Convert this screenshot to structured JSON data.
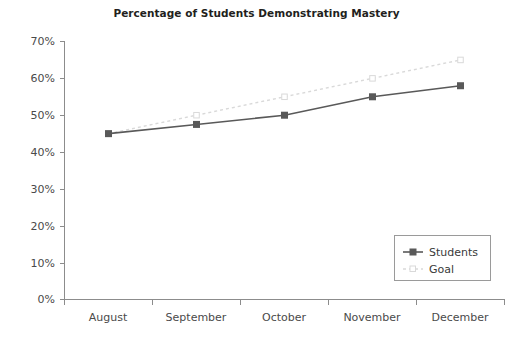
{
  "chart_data": {
    "type": "line",
    "title": "Percentage of Students Demonstrating Mastery",
    "xlabel": "",
    "ylabel": "",
    "categories": [
      "August",
      "September",
      "October",
      "November",
      "December"
    ],
    "series": [
      {
        "name": "Students",
        "values": [
          45,
          47.5,
          50,
          55,
          58
        ],
        "style": "solid",
        "color": "#595959",
        "marker": "square-filled"
      },
      {
        "name": "Goal",
        "values": [
          45,
          50,
          55,
          60,
          65
        ],
        "style": "dotted",
        "color": "#d9d9d9",
        "marker": "square-open"
      }
    ],
    "ylim": [
      0,
      70
    ],
    "ytick_labels": [
      "0%",
      "10%",
      "20%",
      "30%",
      "40%",
      "50%",
      "60%",
      "70%"
    ],
    "ytick_values": [
      0,
      10,
      20,
      30,
      40,
      50,
      60,
      70
    ],
    "grid": false,
    "legend_position": "lower-right",
    "legend_entries": [
      "Students",
      "Goal"
    ]
  },
  "colors": {
    "background": "#ffffff",
    "title": "#231f20",
    "axis": "#8c8c8c",
    "tick_text": "#4a4a4a",
    "students_line": "#595959",
    "goal_line": "#d9d9d9",
    "legend_border": "#9a9a9a"
  }
}
